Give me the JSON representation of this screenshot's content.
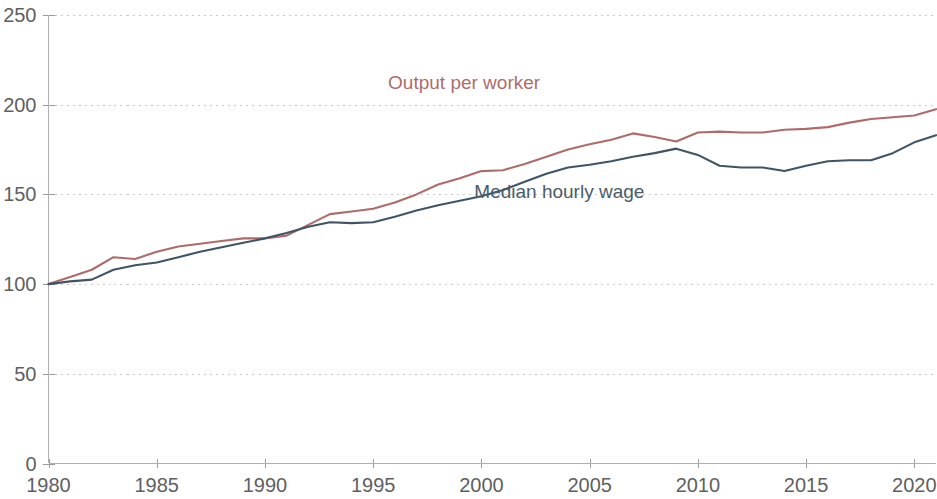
{
  "chart_data": {
    "type": "line",
    "title": "",
    "subtitle": "",
    "xlabel": "",
    "ylabel": "",
    "xlim": [
      1980,
      2021
    ],
    "ylim": [
      0,
      250
    ],
    "grid": true,
    "legend_position": "inline-annotation",
    "x_tick_labels": [
      "1980",
      "1985",
      "1990",
      "1995",
      "2000",
      "2005",
      "2010",
      "2015",
      "2020"
    ],
    "x_ticks": [
      1980,
      1985,
      1990,
      1995,
      2000,
      2005,
      2010,
      2015,
      2020
    ],
    "y_tick_labels": [
      "0",
      "50",
      "100",
      "150",
      "200",
      "250"
    ],
    "y_ticks": [
      0,
      50,
      100,
      150,
      200,
      250
    ],
    "x": [
      1980,
      1981,
      1982,
      1983,
      1984,
      1985,
      1986,
      1987,
      1988,
      1989,
      1990,
      1991,
      1992,
      1993,
      1994,
      1995,
      1996,
      1997,
      1998,
      1999,
      2000,
      2001,
      2002,
      2003,
      2004,
      2005,
      2006,
      2007,
      2008,
      2009,
      2010,
      2011,
      2012,
      2013,
      2014,
      2015,
      2016,
      2017,
      2018,
      2019,
      2020,
      2021
    ],
    "series": [
      {
        "name": "Output per worker",
        "color": "#b06a6a",
        "label_x": 1999.2,
        "label_y": 209,
        "values": [
          100,
          104,
          108,
          115,
          114,
          118,
          121,
          122.5,
          124,
          125.5,
          125.5,
          127,
          133,
          139,
          140.5,
          142,
          145.5,
          150,
          155.5,
          159,
          163,
          163.5,
          167,
          171,
          175,
          178,
          180.5,
          184,
          182,
          179.5,
          184.5,
          185,
          184.5,
          184.5,
          186,
          186.5,
          187.5,
          190,
          192,
          193,
          194,
          197.5
        ]
      },
      {
        "name": "Median hourly wage",
        "color": "#3f5566",
        "label_x": 2003.6,
        "label_y": 148,
        "values": [
          100,
          101.5,
          102.5,
          108,
          110.5,
          112,
          115,
          118,
          120.5,
          123,
          125.5,
          128.5,
          132,
          134.5,
          134,
          134.5,
          137.5,
          141,
          144,
          146.5,
          149,
          152.5,
          157,
          161.5,
          165,
          166.5,
          168.5,
          171,
          173,
          175.5,
          172,
          166,
          165,
          165,
          163,
          166,
          168.5,
          169,
          169,
          173,
          179,
          183
        ]
      }
    ]
  },
  "axis": {
    "y_labels": [
      "250",
      "200",
      "150",
      "100",
      "50",
      "0"
    ],
    "x_labels": [
      "1980",
      "1985",
      "1990",
      "1995",
      "2000",
      "2005",
      "2010",
      "2015",
      "2020"
    ]
  },
  "labels": {
    "output_per_worker": "Output per worker",
    "median_hourly_wage": "Median hourly wage"
  }
}
